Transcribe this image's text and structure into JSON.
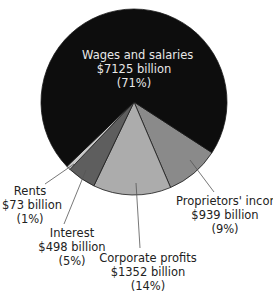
{
  "chart_data": {
    "type": "pie",
    "title": "",
    "unit": "billion dollars",
    "categories": [
      "Wages and salaries",
      "Proprietors' income",
      "Corporate profits",
      "Interest",
      "Rents"
    ],
    "values": [
      7125,
      939,
      1352,
      498,
      73
    ],
    "percentages": [
      71,
      9,
      14,
      5,
      1
    ],
    "colors": [
      "#0d0d0d",
      "#8a8a8a",
      "#acacac",
      "#5e5e5e",
      "#c8c8c8"
    ],
    "start_angle_deg": 33,
    "order_clockwise": [
      "Proprietors' income",
      "Corporate profits",
      "Interest",
      "Rents",
      "Wages and salaries"
    ],
    "labels": [
      {
        "name": "Wages and salaries",
        "value": "$7125 billion",
        "pct": "(71%)"
      },
      {
        "name": "Proprietors' income",
        "value": "$939 billion",
        "pct": "(9%)"
      },
      {
        "name": "Corporate profits",
        "value": "$1352 billion",
        "pct": "(14%)"
      },
      {
        "name": "Interest",
        "value": "$498 billion",
        "pct": "(5%)"
      },
      {
        "name": "Rents",
        "value": "$73 billion",
        "pct": "(1%)"
      }
    ]
  }
}
